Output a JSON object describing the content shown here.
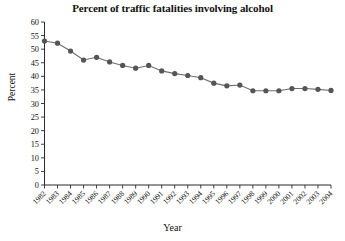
{
  "chart_data": {
    "type": "line",
    "title": "Percent of traffic fatalities involving alcohol",
    "xlabel": "Year",
    "ylabel": "Percent",
    "ylim": [
      0,
      60
    ],
    "ytick_step": 5,
    "yticks": [
      0,
      5,
      10,
      15,
      20,
      25,
      30,
      35,
      40,
      45,
      50,
      55,
      60
    ],
    "grid": false,
    "legend": null,
    "marker": "circle",
    "line_color": "#6d6d6d",
    "marker_color": "#555555",
    "axis_color": "#2b2b2b",
    "background_color": "#ffffff",
    "categories": [
      "1982",
      "1983",
      "1984",
      "1985",
      "1986",
      "1987",
      "1988",
      "1989",
      "1990",
      "1991",
      "1992",
      "1993",
      "1994",
      "1995",
      "1996",
      "1997",
      "1998",
      "1999",
      "2000",
      "2001",
      "2002",
      "2003",
      "2004"
    ],
    "values": [
      53.0,
      52.2,
      49.3,
      46.0,
      47.0,
      45.3,
      44.0,
      43.0,
      44.0,
      42.0,
      41.0,
      40.3,
      39.5,
      37.5,
      36.5,
      36.8,
      34.7,
      34.7,
      34.7,
      35.5,
      35.5,
      35.2,
      34.8
    ]
  }
}
